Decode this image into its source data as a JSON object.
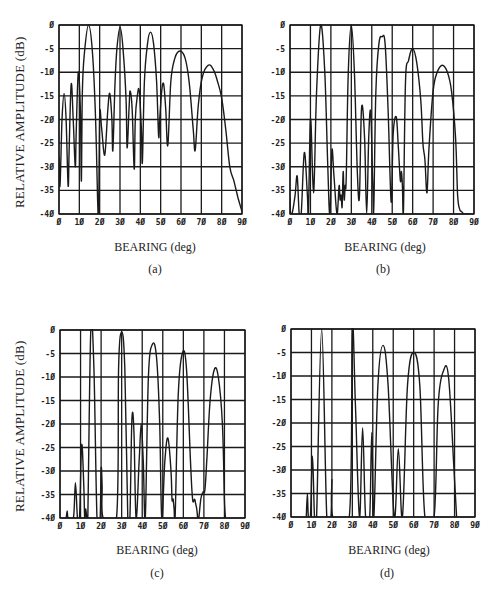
{
  "figure": {
    "ylabel": "RELATIVE AMPLITUDE (dB)",
    "xlabel": "BEARING (deg)"
  },
  "panels": [
    {
      "id": "a",
      "caption": "(a)",
      "frame": {
        "left": 59,
        "top": 25,
        "width": 183,
        "height": 189
      }
    },
    {
      "id": "b",
      "caption": "(b)",
      "frame": {
        "left": 290,
        "top": 25,
        "width": 184,
        "height": 189
      }
    },
    {
      "id": "c",
      "caption": "(c)",
      "frame": {
        "left": 60,
        "top": 330,
        "width": 185,
        "height": 188
      }
    },
    {
      "id": "d",
      "caption": "(d)",
      "frame": {
        "left": 291,
        "top": 329,
        "width": 184,
        "height": 188
      }
    }
  ],
  "colors": {
    "line": "#1a1a1a",
    "grid": "#1a1a1a",
    "background": "#ffffff"
  },
  "chart_data": [
    {
      "panel": "(a)",
      "type": "line",
      "title": "",
      "xlabel": "BEARING (deg)",
      "ylabel": "RELATIVE AMPLITUDE (dB)",
      "xlim": [
        0,
        90
      ],
      "ylim": [
        -40,
        0
      ],
      "xticks": [
        "0",
        "10",
        "20",
        "30",
        "40",
        "50",
        "60",
        "70",
        "80",
        "90"
      ],
      "yticks": [
        "0",
        "-5",
        "-10",
        "-15",
        "-20",
        "-25",
        "-30",
        "-35",
        "-40"
      ],
      "grid": true,
      "peaks": [
        {
          "x": 2.5,
          "y": -14.5
        },
        {
          "x": 6,
          "y": -12.5
        },
        {
          "x": 9.5,
          "y": -10
        },
        {
          "x": 14.5,
          "y": 0
        },
        {
          "x": 20,
          "y": -19
        },
        {
          "x": 25,
          "y": -14.5
        },
        {
          "x": 30,
          "y": -0.5
        },
        {
          "x": 35,
          "y": -14
        },
        {
          "x": 39.5,
          "y": -14
        },
        {
          "x": 45,
          "y": -1.5
        },
        {
          "x": 51.5,
          "y": -12.5
        },
        {
          "x": 59.5,
          "y": -5.5
        },
        {
          "x": 73.5,
          "y": -8.5
        }
      ],
      "series": [
        {
          "name": "response",
          "x": [
            0,
            0.5,
            1.5,
            2.5,
            3.5,
            4.5,
            5,
            6,
            7,
            8,
            8.5,
            9.5,
            10.5,
            11,
            11.5,
            12.5,
            14.5,
            16.5,
            18,
            19,
            19.5,
            20,
            21,
            22.5,
            24,
            25,
            26,
            26.5,
            27.5,
            28.5,
            30,
            31.5,
            33,
            33.5,
            34.5,
            35,
            36,
            37,
            37.5,
            38.5,
            39.5,
            40.5,
            41,
            42,
            43.5,
            45,
            46.5,
            48,
            49,
            49.5,
            50.5,
            51.5,
            52.5,
            53.5,
            55,
            57,
            59.5,
            62,
            64,
            66,
            67,
            68.5,
            70.5,
            73.5,
            76,
            78,
            80,
            82,
            84,
            86,
            88,
            90
          ],
          "values": [
            -28,
            -34,
            -20,
            -14.5,
            -20,
            -34,
            -26,
            -12.5,
            -20,
            -30,
            -22,
            -10,
            -18,
            -33,
            -14,
            -6,
            0,
            -6,
            -20,
            -37,
            -40,
            -19,
            -22,
            -27.5,
            -18,
            -14.5,
            -20,
            -26.5,
            -13,
            -5,
            -0.5,
            -5,
            -16,
            -26,
            -17,
            -14,
            -18,
            -30.5,
            -20,
            -15,
            -14,
            -22,
            -29,
            -12,
            -4,
            -1.5,
            -4,
            -12,
            -23.5,
            -20,
            -14,
            -12.5,
            -18,
            -25.5,
            -12,
            -7,
            -5.5,
            -7,
            -12,
            -22,
            -26.5,
            -17,
            -11,
            -8.5,
            -9.5,
            -12,
            -15.5,
            -22,
            -30,
            -33,
            -36.5,
            -39.5
          ]
        }
      ]
    },
    {
      "panel": "(b)",
      "type": "line",
      "xlabel": "BEARING (deg)",
      "xlim": [
        0,
        90
      ],
      "ylim": [
        -40,
        0
      ],
      "xticks": [
        "0",
        "10",
        "20",
        "30",
        "40",
        "50",
        "60",
        "70",
        "80",
        "90"
      ],
      "yticks": [
        "0",
        "-5",
        "-10",
        "-15",
        "-20",
        "-25",
        "-30",
        "-35",
        "-40"
      ],
      "grid": true,
      "peaks": [
        {
          "x": 3.5,
          "y": -32
        },
        {
          "x": 7,
          "y": -27
        },
        {
          "x": 10,
          "y": -20
        },
        {
          "x": 15,
          "y": 0
        },
        {
          "x": 20,
          "y": -26.5
        },
        {
          "x": 26,
          "y": -31
        },
        {
          "x": 30,
          "y": 0
        },
        {
          "x": 35,
          "y": -17.5
        },
        {
          "x": 39.5,
          "y": -18.5
        },
        {
          "x": 45,
          "y": -2.5
        },
        {
          "x": 52,
          "y": -19.5
        },
        {
          "x": 60,
          "y": -5
        },
        {
          "x": 74.5,
          "y": -8.5
        }
      ],
      "series": [
        {
          "name": "response",
          "x": [
            0,
            0.3,
            1,
            2.5,
            3.5,
            4.5,
            5.5,
            7,
            8.5,
            9,
            10,
            11,
            11.5,
            12,
            13,
            15,
            17,
            18.5,
            19.5,
            20.5,
            21.5,
            23,
            24,
            24.5,
            25,
            25.5,
            26,
            26.5,
            27,
            27.5,
            28.5,
            30,
            31.5,
            33,
            34,
            35,
            36.5,
            37.5,
            38.5,
            39.5,
            40.5,
            41,
            42,
            43.5,
            45,
            46.5,
            48,
            49.5,
            50.5,
            52,
            53,
            54,
            54.5,
            55,
            55.5,
            56.5,
            58,
            60,
            62,
            64,
            65,
            66,
            67,
            68,
            70,
            72,
            74.5,
            77,
            79,
            81,
            82,
            83,
            84,
            85,
            86,
            88
          ],
          "values": [
            -36.5,
            -40,
            -40,
            -36,
            -32,
            -40,
            -40,
            -27,
            -36,
            -40,
            -20,
            -31,
            -35.5,
            -31,
            -14,
            0,
            -10,
            -30,
            -40,
            -26.5,
            -32,
            -40,
            -34,
            -37,
            -36,
            -38.5,
            -31,
            -37,
            -34,
            -32.5,
            -10,
            0,
            -10,
            -32,
            -36,
            -17.5,
            -24,
            -40,
            -24,
            -18.5,
            -34,
            -38.5,
            -14,
            -4,
            -2.5,
            -4,
            -18,
            -37.5,
            -23,
            -19.5,
            -26,
            -33,
            -31,
            -34,
            -39,
            -12,
            -7.5,
            -5,
            -8,
            -16,
            -25,
            -28.5,
            -35.5,
            -26,
            -14,
            -10,
            -8.5,
            -10,
            -14,
            -24,
            -36,
            -39,
            -39.5,
            -40,
            -40,
            -40
          ]
        }
      ]
    },
    {
      "panel": "(c)",
      "type": "line",
      "xlabel": "BEARING (deg)",
      "ylabel": "RELATIVE AMPLITUDE (dB)",
      "xlim": [
        0,
        90
      ],
      "ylim": [
        -40,
        0
      ],
      "xticks": [
        "0",
        "10",
        "20",
        "30",
        "40",
        "50",
        "60",
        "70",
        "80",
        "90"
      ],
      "yticks": [
        "0",
        "-5",
        "-10",
        "-15",
        "-20",
        "-25",
        "-30",
        "-35",
        "-40"
      ],
      "grid": true,
      "peaks": [
        {
          "x": 3.5,
          "y": -38.5
        },
        {
          "x": 7.5,
          "y": -32.5
        },
        {
          "x": 10.5,
          "y": -24.5
        },
        {
          "x": 12.5,
          "y": -38
        },
        {
          "x": 15,
          "y": 0
        },
        {
          "x": 20,
          "y": -29.5
        },
        {
          "x": 30,
          "y": -0.5
        },
        {
          "x": 35,
          "y": -19
        },
        {
          "x": 39.5,
          "y": -20
        },
        {
          "x": 45,
          "y": -3
        },
        {
          "x": 52.5,
          "y": -23
        },
        {
          "x": 55,
          "y": -36
        },
        {
          "x": 59.5,
          "y": -5
        },
        {
          "x": 66,
          "y": -36
        },
        {
          "x": 75,
          "y": -8.5
        }
      ],
      "series": [
        {
          "name": "response",
          "x": [
            3,
            3.5,
            4,
            6.5,
            7.5,
            8.5,
            9.5,
            10.5,
            11.5,
            12,
            12.5,
            13,
            13.5,
            15,
            16.5,
            18,
            19.5,
            20,
            20.5,
            21,
            27.5,
            28.5,
            30,
            31.5,
            33,
            34,
            35,
            36,
            37,
            38.5,
            39.5,
            40.5,
            41.5,
            43,
            45,
            47,
            48.5,
            49.5,
            51,
            52.5,
            54,
            54.5,
            55,
            55.5,
            56,
            57.5,
            59.5,
            61.5,
            63.5,
            64.5,
            65.5,
            66,
            66.5,
            67,
            67.5,
            68.5,
            69.5,
            70.5,
            71.5,
            73,
            75,
            77,
            79,
            80,
            80.5
          ],
          "values": [
            -40,
            -38.5,
            -40,
            -40,
            -32.5,
            -40,
            -40,
            -24.5,
            -32,
            -40,
            -38,
            -40,
            -40,
            0,
            -8,
            -40,
            -40,
            -29.5,
            -33,
            -40,
            -40,
            -8,
            -0.5,
            -8,
            -40,
            -40,
            -19,
            -22,
            -40,
            -28,
            -20,
            -28,
            -40,
            -10,
            -3,
            -6,
            -20,
            -40,
            -28,
            -23,
            -30,
            -36,
            -36,
            -38,
            -40,
            -14,
            -5,
            -8,
            -28,
            -36,
            -36,
            -37,
            -38,
            -40,
            -40,
            -36,
            -34.5,
            -34,
            -27,
            -15,
            -8.5,
            -10,
            -20,
            -36,
            -40
          ]
        }
      ]
    },
    {
      "panel": "(d)",
      "type": "line",
      "xlabel": "BEARING (deg)",
      "xlim": [
        0,
        90
      ],
      "ylim": [
        -40,
        0
      ],
      "xticks": [
        "0",
        "10",
        "20",
        "30",
        "40",
        "50",
        "60",
        "70",
        "80",
        "90"
      ],
      "yticks": [
        "0",
        "-5",
        "-10",
        "-15",
        "-20",
        "-25",
        "-30",
        "-35",
        "-40"
      ],
      "grid": true,
      "peaks": [
        {
          "x": 8,
          "y": -35
        },
        {
          "x": 10.5,
          "y": -27
        },
        {
          "x": 15,
          "y": 0
        },
        {
          "x": 20,
          "y": -32
        },
        {
          "x": 30,
          "y": 0
        },
        {
          "x": 35,
          "y": -21
        },
        {
          "x": 39.5,
          "y": -22
        },
        {
          "x": 45,
          "y": -3.5
        },
        {
          "x": 52.5,
          "y": -25.5
        },
        {
          "x": 60,
          "y": -5
        },
        {
          "x": 74.5,
          "y": -9
        }
      ],
      "series": [
        {
          "name": "response",
          "x": [
            7.5,
            8,
            8.5,
            9.5,
            10.5,
            11.5,
            12.5,
            15,
            17.5,
            19.5,
            20,
            20.5,
            28.5,
            30,
            31.5,
            33.5,
            35,
            36.5,
            38.5,
            39.5,
            40.5,
            42.5,
            45,
            47.5,
            50.5,
            52.5,
            54.5,
            57,
            60,
            63,
            65.5,
            70,
            72,
            74.5,
            77,
            79.5,
            81
          ],
          "values": [
            -40,
            -35,
            -40,
            -40,
            -27,
            -40,
            -40,
            0,
            -40,
            -40,
            -32,
            -40,
            -40,
            0,
            -16,
            -40,
            -21,
            -40,
            -40,
            -22,
            -40,
            -12,
            -3.5,
            -12,
            -40,
            -25.5,
            -40,
            -12,
            -5,
            -12,
            -40,
            -40,
            -16,
            -9,
            -10,
            -28,
            -40
          ]
        }
      ]
    }
  ]
}
